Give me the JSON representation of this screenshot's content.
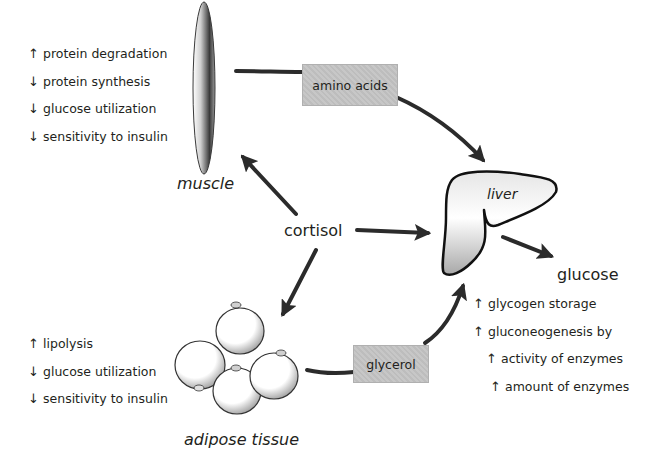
{
  "diagram": {
    "center": {
      "label": "cortisol"
    },
    "muscle": {
      "label": "muscle",
      "effects": [
        {
          "direction": "up",
          "text": "protein degradation"
        },
        {
          "direction": "down",
          "text": "protein synthesis"
        },
        {
          "direction": "down",
          "text": "glucose utilization"
        },
        {
          "direction": "down",
          "text": "sensitivity to insulin"
        }
      ]
    },
    "adipose": {
      "label": "adipose tissue",
      "effects": [
        {
          "direction": "up",
          "text": "lipolysis"
        },
        {
          "direction": "down",
          "text": "glucose utilization"
        },
        {
          "direction": "down",
          "text": "sensitivity to insulin"
        }
      ]
    },
    "liver": {
      "label": "liver",
      "effects": [
        {
          "direction": "up",
          "text": "glycogen storage"
        },
        {
          "direction": "up",
          "text": "gluconeogenesis by"
        },
        {
          "direction": "up",
          "text": "activity of enzymes"
        },
        {
          "direction": "up",
          "text": "amount of enzymes"
        }
      ]
    },
    "output": {
      "label": "glucose"
    },
    "substrates": {
      "amino_acids": "amino acids",
      "glycerol": "glycerol"
    },
    "icons": {
      "up": "↑",
      "down": "↓"
    },
    "colors": {
      "arrow": "#2b2b2b",
      "text": "#231f20",
      "box_fill": "#c4c4c4"
    }
  }
}
